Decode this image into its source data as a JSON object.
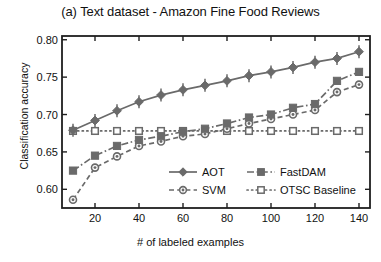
{
  "chart_data": {
    "type": "line",
    "title": "(a) Text dataset - Amazon Fine Food Reviews",
    "xlabel": "# of labeled examples",
    "ylabel": "Classification accuracy",
    "xlim": [
      5,
      145
    ],
    "ylim": [
      0.575,
      0.805
    ],
    "xticks": [
      20,
      40,
      60,
      80,
      100,
      120,
      140
    ],
    "yticks": [
      0.6,
      0.65,
      0.7,
      0.75,
      0.8
    ],
    "ytick_labels": [
      "0.60",
      "0.65",
      "0.70",
      "0.75",
      "0.80"
    ],
    "xtick_labels": [
      "20",
      "40",
      "60",
      "80",
      "100",
      "120",
      "140"
    ],
    "grid": false,
    "legend_position": "lower right",
    "x": [
      10,
      20,
      30,
      40,
      50,
      60,
      70,
      80,
      90,
      100,
      110,
      120,
      130,
      140
    ],
    "series": [
      {
        "name": "AOT",
        "marker": "diamond",
        "linestyle": "solid",
        "color": "#676767",
        "has_error_bars": true,
        "values": [
          0.679,
          0.692,
          0.705,
          0.717,
          0.726,
          0.733,
          0.739,
          0.745,
          0.752,
          0.757,
          0.763,
          0.77,
          0.775,
          0.784
        ]
      },
      {
        "name": "FastDAM",
        "marker": "square",
        "linestyle": "dashdot",
        "color": "#676767",
        "has_error_bars": false,
        "values": [
          0.625,
          0.645,
          0.658,
          0.666,
          0.671,
          0.677,
          0.681,
          0.688,
          0.696,
          0.7,
          0.709,
          0.714,
          0.745,
          0.757
        ]
      },
      {
        "name": "SVM",
        "marker": "circle",
        "linestyle": "dashed",
        "color": "#676767",
        "has_error_bars": false,
        "values": [
          0.586,
          0.629,
          0.644,
          0.658,
          0.664,
          0.671,
          0.674,
          0.681,
          0.688,
          0.694,
          0.7,
          0.706,
          0.73,
          0.74
        ]
      },
      {
        "name": "OTSC Baseline",
        "marker": "open-square",
        "linestyle": "dotted",
        "color": "#676767",
        "has_error_bars": false,
        "values": [
          0.678,
          0.678,
          0.678,
          0.678,
          0.678,
          0.678,
          0.678,
          0.678,
          0.678,
          0.678,
          0.678,
          0.678,
          0.678,
          0.678
        ]
      }
    ]
  },
  "legend": {
    "entries": [
      {
        "label": "AOT"
      },
      {
        "label": "FastDAM"
      },
      {
        "label": "SVM"
      },
      {
        "label": "OTSC Baseline"
      }
    ]
  }
}
